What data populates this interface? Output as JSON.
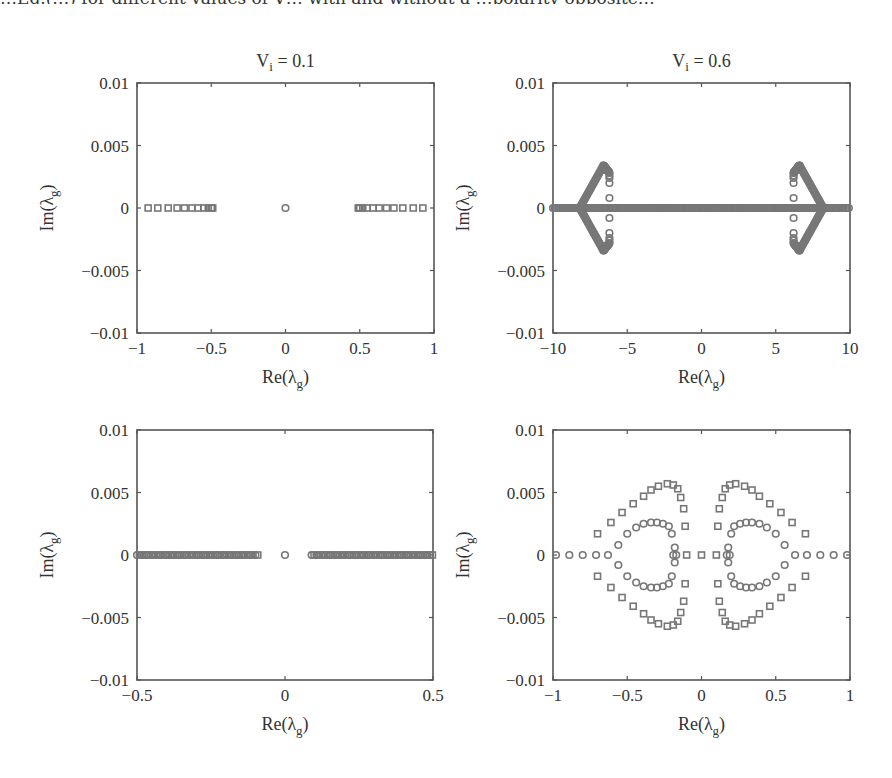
{
  "figure": {
    "cutoff_text": "…Eq.(…) for different values of V… with and without a …polarity opposite…",
    "marker_color": "#777777",
    "frame_color": "#555555",
    "text_color": "#333333"
  },
  "chart_data": [
    {
      "id": "top-left",
      "type": "scatter",
      "title": "V_i = 0.1",
      "title_main": "V",
      "title_sub": "i",
      "title_rest": " = 0.1",
      "xlabel": "Re(λ_g)",
      "ylabel": "Im(λ_g)",
      "xlim": [
        -1,
        1
      ],
      "ylim": [
        -0.01,
        0.01
      ],
      "xticks": [
        -1,
        -0.5,
        0,
        0.5,
        1
      ],
      "xtick_labels": [
        "−1",
        "−0.5",
        "0",
        "0.5",
        "1"
      ],
      "yticks": [
        0.01,
        0.005,
        0,
        -0.005,
        -0.01
      ],
      "ytick_labels": [
        "0.01",
        "0.005",
        "0",
        "−0.005",
        "−0.01"
      ],
      "grid": false,
      "series": [
        {
          "name": "squares",
          "marker": "square",
          "points": [
            [
              -0.925,
              0
            ],
            [
              -0.86,
              0
            ],
            [
              -0.79,
              0
            ],
            [
              -0.73,
              0
            ],
            [
              -0.68,
              0
            ],
            [
              -0.63,
              0
            ],
            [
              -0.59,
              0
            ],
            [
              -0.55,
              0
            ],
            [
              -0.52,
              0
            ],
            [
              -0.5,
              0
            ],
            [
              -0.49,
              0
            ],
            [
              0.49,
              0
            ],
            [
              0.5,
              0
            ],
            [
              0.52,
              0
            ],
            [
              0.55,
              0
            ],
            [
              0.59,
              0
            ],
            [
              0.63,
              0
            ],
            [
              0.68,
              0
            ],
            [
              0.73,
              0
            ],
            [
              0.79,
              0
            ],
            [
              0.86,
              0
            ],
            [
              0.925,
              0
            ]
          ]
        },
        {
          "name": "circles",
          "marker": "circle",
          "points": [
            [
              0,
              0
            ]
          ]
        }
      ]
    },
    {
      "id": "top-right",
      "type": "scatter",
      "title": "V_i = 0.6",
      "title_main": "V",
      "title_sub": "i",
      "title_rest": " = 0.6",
      "xlabel": "Re(λ_g)",
      "ylabel": "Im(λ_g)",
      "xlim": [
        -10,
        10
      ],
      "ylim": [
        -0.01,
        0.01
      ],
      "xticks": [
        -10,
        -5,
        0,
        5,
        10
      ],
      "xtick_labels": [
        "−10",
        "−5",
        "0",
        "5",
        "10"
      ],
      "yticks": [
        0.01,
        0.005,
        0,
        -0.005,
        -0.01
      ],
      "ytick_labels": [
        "0.01",
        "0.005",
        "0",
        "−0.005",
        "−0.01"
      ],
      "grid": false,
      "series": [
        {
          "name": "real-axis dense circles",
          "marker": "circle",
          "dense_range": [
            -10,
            10
          ],
          "im": 0
        },
        {
          "name": "lobe arms",
          "marker": "circle",
          "arms": [
            {
              "from": [
                -8.2,
                0
              ],
              "to": [
                -6.6,
                0.0034
              ]
            },
            {
              "from": [
                -6.6,
                0.0034
              ],
              "to": [
                -6.2,
                0.0028
              ]
            },
            {
              "from": [
                -8.2,
                0
              ],
              "to": [
                -6.6,
                -0.0034
              ]
            },
            {
              "from": [
                -6.6,
                -0.0034
              ],
              "to": [
                -6.2,
                -0.0028
              ]
            },
            {
              "from": [
                8.2,
                0
              ],
              "to": [
                6.6,
                0.0034
              ]
            },
            {
              "from": [
                6.6,
                0.0034
              ],
              "to": [
                6.2,
                0.0028
              ]
            },
            {
              "from": [
                8.2,
                0
              ],
              "to": [
                6.6,
                -0.0034
              ]
            },
            {
              "from": [
                6.6,
                -0.0034
              ],
              "to": [
                6.2,
                -0.0028
              ]
            }
          ]
        },
        {
          "name": "lobe inner column",
          "marker": "circle",
          "points": [
            [
              -6.2,
              0.0026
            ],
            [
              -6.2,
              0.0024
            ],
            [
              -6.2,
              0.002
            ],
            [
              -6.2,
              0.0008
            ],
            [
              -6.2,
              -0.0008
            ],
            [
              -6.2,
              -0.002
            ],
            [
              -6.2,
              -0.0024
            ],
            [
              -6.2,
              -0.0026
            ],
            [
              6.2,
              0.0026
            ],
            [
              6.2,
              0.0024
            ],
            [
              6.2,
              0.002
            ],
            [
              6.2,
              0.0008
            ],
            [
              6.2,
              -0.0008
            ],
            [
              6.2,
              -0.002
            ],
            [
              6.2,
              -0.0024
            ],
            [
              6.2,
              -0.0026
            ]
          ]
        },
        {
          "name": "clusters on axis",
          "marker": "circle",
          "points": [
            [
              -2.6,
              0
            ],
            [
              -2.4,
              0
            ],
            [
              -2.2,
              0
            ],
            [
              2.2,
              0
            ],
            [
              2.4,
              0
            ],
            [
              2.6,
              0
            ],
            [
              0,
              0
            ]
          ]
        }
      ]
    },
    {
      "id": "bottom-left",
      "type": "scatter",
      "title": "",
      "xlabel": "Re(λ_g)",
      "ylabel": "Im(λ_g)",
      "xlim": [
        -0.5,
        0.5
      ],
      "ylim": [
        -0.01,
        0.01
      ],
      "xticks": [
        -0.5,
        0,
        0.5
      ],
      "xtick_labels": [
        "−0.5",
        "0",
        "0.5"
      ],
      "yticks": [
        0.01,
        0.005,
        0,
        -0.005,
        -0.01
      ],
      "ytick_labels": [
        "0.01",
        "0.005",
        "0",
        "−0.005",
        "−0.01"
      ],
      "grid": false,
      "series": [
        {
          "name": "real-axis dense markers",
          "marker": "mixed",
          "dense_ranges": [
            [
              -0.5,
              -0.09
            ],
            [
              0.09,
              0.5
            ]
          ],
          "im": 0
        },
        {
          "name": "origin",
          "marker": "circle",
          "points": [
            [
              0,
              0
            ]
          ]
        }
      ]
    },
    {
      "id": "bottom-right",
      "type": "scatter",
      "title": "",
      "xlabel": "Re(λ_g)",
      "ylabel": "Im(λ_g)",
      "xlim": [
        -1,
        1
      ],
      "ylim": [
        -0.01,
        0.01
      ],
      "xticks": [
        -1,
        -0.5,
        0,
        0.5,
        1
      ],
      "xtick_labels": [
        "−1",
        "−0.5",
        "0",
        "0.5",
        "1"
      ],
      "yticks": [
        0.01,
        0.005,
        0,
        -0.005,
        -0.01
      ],
      "ytick_labels": [
        "0.01",
        "0.005",
        "0",
        "−0.005",
        "−0.01"
      ],
      "grid": false,
      "series": [
        {
          "name": "squares (outer arcs)",
          "marker": "square",
          "points_half": [
            [
              -0.7,
              0.0017
            ],
            [
              -0.61,
              0.0026
            ],
            [
              -0.535,
              0.0034
            ],
            [
              -0.46,
              0.0041
            ],
            [
              -0.39,
              0.0047
            ],
            [
              -0.34,
              0.0052
            ],
            [
              -0.29,
              0.0055
            ],
            [
              -0.23,
              0.0057
            ],
            [
              -0.19,
              0.0056
            ],
            [
              -0.16,
              0.0053
            ],
            [
              -0.14,
              0.0046
            ],
            [
              -0.12,
              0.0037
            ],
            [
              -0.11,
              0.0023
            ]
          ],
          "axis_points": [
            [
              -0.1,
              0
            ],
            [
              0,
              0
            ],
            [
              0.1,
              0
            ]
          ],
          "symmetry": "mirrored in Re and Im"
        },
        {
          "name": "circles (inner arcs)",
          "marker": "circle",
          "points_half": [
            [
              -0.56,
              0.0008
            ],
            [
              -0.5,
              0.0017
            ],
            [
              -0.44,
              0.0022
            ],
            [
              -0.39,
              0.0025
            ],
            [
              -0.34,
              0.0026
            ],
            [
              -0.3,
              0.0026
            ],
            [
              -0.26,
              0.0025
            ],
            [
              -0.22,
              0.0023
            ],
            [
              -0.2,
              0.0017
            ],
            [
              -0.18,
              0.0006
            ]
          ],
          "axis_points": [
            [
              -0.98,
              0
            ],
            [
              -0.89,
              0
            ],
            [
              -0.8,
              0
            ],
            [
              -0.71,
              0
            ],
            [
              -0.63,
              0
            ],
            [
              -0.19,
              0
            ],
            [
              -0.17,
              0
            ],
            [
              0.17,
              0
            ],
            [
              0.19,
              0
            ],
            [
              0.63,
              0
            ],
            [
              0.71,
              0
            ],
            [
              0.8,
              0
            ],
            [
              0.89,
              0
            ],
            [
              0.98,
              0
            ]
          ],
          "symmetry": "mirrored in Re and Im"
        }
      ]
    }
  ]
}
